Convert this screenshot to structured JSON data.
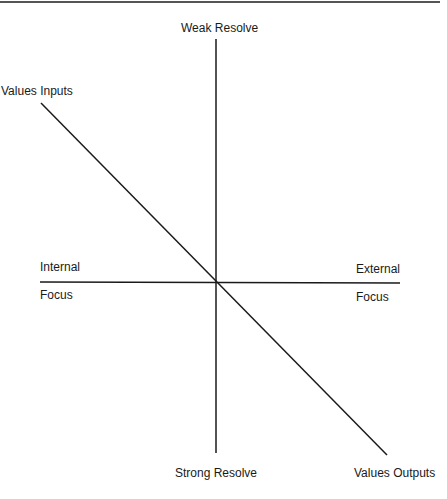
{
  "diagram": {
    "type": "quadrant-axes",
    "axes": {
      "vertical": {
        "top_label": "Weak Resolve",
        "bottom_label": "Strong Resolve"
      },
      "horizontal": {
        "left_label_top": "Internal",
        "left_label_bottom": "Focus",
        "right_label_top": "External",
        "right_label_bottom": "Focus"
      },
      "diagonal": {
        "start_label": "Values Inputs",
        "end_label": "Values Outputs"
      }
    },
    "line_color": "#1a1a1a",
    "rule_color": "#555555"
  }
}
